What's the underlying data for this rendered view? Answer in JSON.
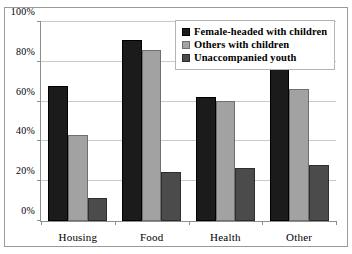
{
  "chart_data": {
    "type": "bar",
    "title": "",
    "subtitle": "",
    "xlabel": "",
    "ylabel": "",
    "categories": [
      "Housing",
      "Food",
      "Health",
      "Other"
    ],
    "series": [
      {
        "name": "Female-headed with children",
        "color": "#1b1b1b",
        "values": [
          68,
          91,
          62.5,
          77
        ]
      },
      {
        "name": "Others with children",
        "color": "#a2a2a2",
        "values": [
          43,
          86,
          60.5,
          66.5
        ]
      },
      {
        "name": "Unaccompanied youth",
        "color": "#4b4b4b",
        "values": [
          11.5,
          24.5,
          26.5,
          28
        ]
      }
    ],
    "ylim": [
      0,
      100
    ],
    "ytick_values": [
      0,
      20,
      40,
      60,
      80,
      100
    ],
    "ytick_labels": [
      "0%",
      "20%",
      "40%",
      "60%",
      "80%",
      "100%"
    ],
    "value_suffix": "%",
    "grid": true,
    "grid_axis": "y",
    "legend_position": "top-right",
    "legend_entries": [
      "Female-headed with children",
      "Others with children",
      "Unaccompanied youth"
    ]
  },
  "colors": {
    "series_0": "#1b1b1b",
    "series_1": "#a2a2a2",
    "series_2": "#4b4b4b",
    "gridline": "#c9c9c9",
    "axis": "#8d8d8d",
    "frame": "#9a9a9a",
    "background": "#ffffff",
    "text": "#000000"
  }
}
